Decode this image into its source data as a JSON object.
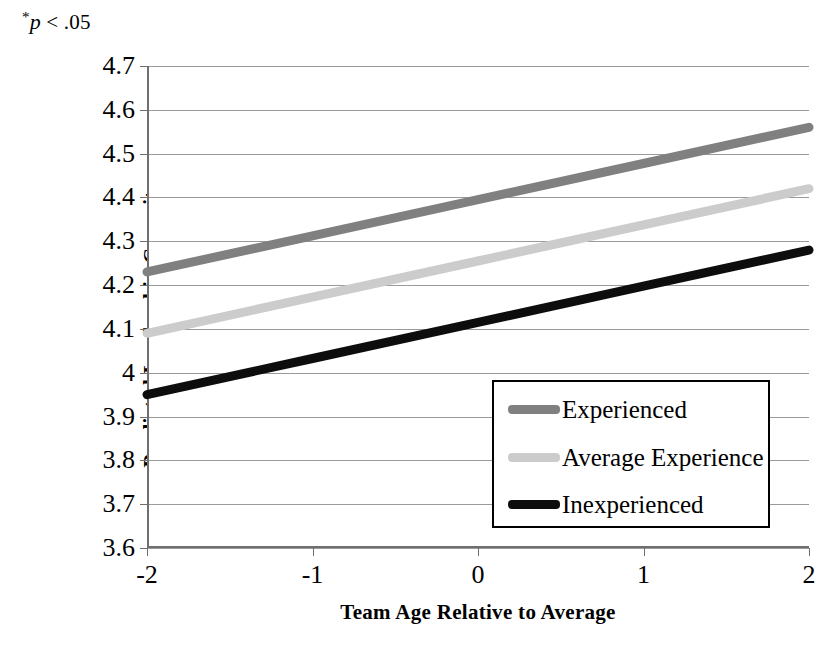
{
  "annotation": {
    "star": "*",
    "text": "p < .05",
    "p_symbol": "p",
    "rest": " < .05"
  },
  "chart_data": {
    "type": "line",
    "title": "",
    "subtitle": "",
    "xlabel": "Team Age Relative to Average",
    "ylabel": "Predicted Leadership Capacity",
    "x": [
      -2,
      -1,
      0,
      1,
      2
    ],
    "xticklabels": [
      "-2",
      "-1",
      "0",
      "1",
      "2"
    ],
    "xlim": [
      -2,
      2
    ],
    "ylim": [
      3.6,
      4.7
    ],
    "yticks": [
      4.7,
      4.6,
      4.5,
      4.4,
      4.3,
      4.2,
      4.1,
      4,
      3.9,
      3.8,
      3.7,
      3.6
    ],
    "yticklabels": [
      "4.7",
      "4.6",
      "4.5",
      "4.4",
      "4.3",
      "4.2",
      "4.1",
      "4",
      "3.9",
      "3.8",
      "3.7",
      "3.6"
    ],
    "grid": "horizontal",
    "legend_position": "center-right-inside",
    "annotation": "*p < .05",
    "series": [
      {
        "name": "Experienced",
        "color": "#808080",
        "values": [
          4.23,
          4.3125,
          4.395,
          4.4775,
          4.56
        ],
        "endpoints": {
          "start": 4.23,
          "end": 4.56
        }
      },
      {
        "name": "Average Experience",
        "color": "#cccccc",
        "values": [
          4.09,
          4.1725,
          4.255,
          4.3375,
          4.42
        ],
        "endpoints": {
          "start": 4.09,
          "end": 4.42
        }
      },
      {
        "name": "Inexperienced",
        "color": "#0d0d0d",
        "values": [
          3.95,
          4.0325,
          4.115,
          4.1975,
          4.28
        ],
        "endpoints": {
          "start": 3.95,
          "end": 4.28
        }
      }
    ]
  },
  "legend": {
    "items": [
      {
        "label": "Experienced",
        "color": "#808080"
      },
      {
        "label": "Average Experience",
        "color": "#cccccc"
      },
      {
        "label": "Inexperienced",
        "color": "#0d0d0d"
      }
    ]
  },
  "colors": {
    "grid": "#9a9a9a",
    "axis": "#6f6f6f",
    "text": "#000000",
    "background": "#ffffff"
  }
}
